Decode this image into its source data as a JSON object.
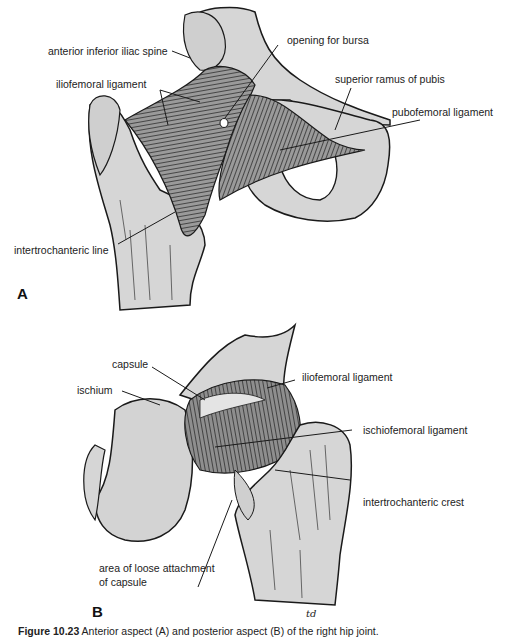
{
  "figure": {
    "panel_a": {
      "letter": "A",
      "labels": {
        "aiis": "anterior inferior iliac spine",
        "bursa": "opening for bursa",
        "iliofemoral": "iliofemoral ligament",
        "superior_ramus": "superior ramus of pubis",
        "pubofemoral": "pubofemoral ligament",
        "intertrochanteric_line": "intertrochanteric line"
      }
    },
    "panel_b": {
      "letter": "B",
      "labels": {
        "capsule": "capsule",
        "ischium": "ischium",
        "iliofemoral": "iliofemoral ligament",
        "ischiofemoral": "ischiofemoral ligament",
        "intertrochanteric_crest": "intertrochanteric crest",
        "loose_line1": "area of loose attachment",
        "loose_line2": "of capsule"
      }
    },
    "signature": "td",
    "caption": {
      "fig_no": "Figure 10.23",
      "text": " Anterior aspect (A) and posterior aspect (B) of the right hip joint."
    },
    "colors": {
      "bone": "#d9d9d9",
      "ink": "#1a1a1a",
      "ligament": "#8a8a8a"
    }
  }
}
